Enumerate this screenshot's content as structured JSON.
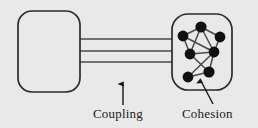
{
  "diagram": {
    "background_color": "#e9e9e9",
    "stroke_color": "#2b2b2b",
    "node_color": "#111111",
    "edge_color": "#4a4a4a",
    "modules": [
      {
        "id": "module-left",
        "name": "left-module",
        "shape": "rounded-rectangle",
        "x": 18,
        "y": 11,
        "width": 62,
        "height": 81,
        "radius": 14,
        "fill": "#e9e9e9"
      },
      {
        "id": "module-right",
        "name": "right-module",
        "shape": "rounded-rectangle",
        "x": 172,
        "y": 14,
        "width": 60,
        "height": 76,
        "radius": 16,
        "fill": "#e9e9e9"
      }
    ],
    "coupling_lines": [
      {
        "x1": 80,
        "y1": 39,
        "x2": 173,
        "y2": 39
      },
      {
        "x1": 80,
        "y1": 51,
        "x2": 173,
        "y2": 51
      },
      {
        "x1": 80,
        "y1": 62,
        "x2": 173,
        "y2": 62
      }
    ],
    "nodes": [
      {
        "id": "n1",
        "label": "node-top",
        "cx": 201,
        "cy": 27,
        "r": 5.6
      },
      {
        "id": "n2",
        "label": "node-upper-left",
        "cx": 183,
        "cy": 36,
        "r": 5.4
      },
      {
        "id": "n3",
        "label": "node-upper-right",
        "cx": 220,
        "cy": 37,
        "r": 5.4
      },
      {
        "id": "n4",
        "label": "node-mid-left",
        "cx": 190,
        "cy": 54,
        "r": 5.4
      },
      {
        "id": "n5",
        "label": "node-mid-right",
        "cx": 214,
        "cy": 52,
        "r": 5.4
      },
      {
        "id": "n6",
        "label": "node-bottom-mid",
        "cx": 209,
        "cy": 72,
        "r": 5.6
      },
      {
        "id": "n7",
        "label": "node-bottom-left",
        "cx": 188,
        "cy": 77,
        "r": 5.4
      }
    ],
    "edges": [
      {
        "from": "n1",
        "to": "n2"
      },
      {
        "from": "n1",
        "to": "n3"
      },
      {
        "from": "n1",
        "to": "n4"
      },
      {
        "from": "n1",
        "to": "n5"
      },
      {
        "from": "n2",
        "to": "n4"
      },
      {
        "from": "n2",
        "to": "n5"
      },
      {
        "from": "n3",
        "to": "n5"
      },
      {
        "from": "n4",
        "to": "n5"
      },
      {
        "from": "n4",
        "to": "n6"
      },
      {
        "from": "n5",
        "to": "n6"
      },
      {
        "from": "n5",
        "to": "n7"
      },
      {
        "from": "n6",
        "to": "n7"
      }
    ],
    "annotations": [
      {
        "id": "ann-coupling",
        "label": "Coupling",
        "arrow": {
          "x1": 123,
          "y1": 105,
          "x2": 123,
          "y2": 84,
          "direction": "up"
        },
        "label_x": 93,
        "label_y": 106
      },
      {
        "id": "ann-cohesion",
        "label": "Cohesion",
        "arrow": {
          "x1": 213,
          "y1": 104,
          "x2": 201,
          "y2": 81,
          "direction": "up-left"
        },
        "label_x": 182,
        "label_y": 106
      }
    ]
  }
}
